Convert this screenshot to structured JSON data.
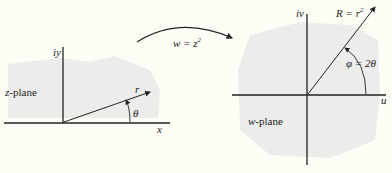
{
  "diagram": {
    "colors": {
      "background": "#fdfdf6",
      "region": "#ececea",
      "ink": "#222222"
    },
    "mapping": {
      "label_prefix": "w = z",
      "exponent": "2"
    },
    "z_plane": {
      "name": "z-plane",
      "x_axis": "x",
      "y_axis": "iy",
      "vector": "r",
      "angle": "θ"
    },
    "w_plane": {
      "name": "w-plane",
      "x_axis": "u",
      "y_axis": "iv",
      "vector": "R = r",
      "vector_exp": "2",
      "angle": "φ = 2θ"
    }
  }
}
